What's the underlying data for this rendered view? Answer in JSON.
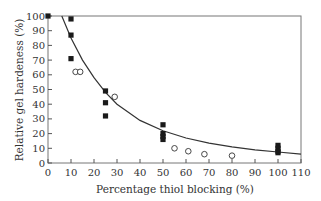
{
  "chart_data": {
    "type": "scatter",
    "title": "",
    "xlabel": "Percentage thiol blocking (%)",
    "ylabel": "Relative gel hardeness (%)",
    "xlim": [
      0,
      110
    ],
    "ylim": [
      0,
      100
    ],
    "x_ticks": [
      0,
      10,
      20,
      30,
      40,
      50,
      60,
      70,
      80,
      90,
      100,
      110
    ],
    "y_ticks": [
      0,
      10,
      20,
      30,
      40,
      50,
      60,
      70,
      80,
      90,
      100
    ],
    "grid": false,
    "legend": null,
    "series": [
      {
        "name": "filled squares",
        "marker": "square-filled",
        "color": "#1a1a1a",
        "points": [
          [
            0,
            100
          ],
          [
            10,
            98
          ],
          [
            10,
            87
          ],
          [
            10,
            71
          ],
          [
            25,
            49
          ],
          [
            25,
            41
          ],
          [
            25,
            32
          ],
          [
            50,
            26
          ],
          [
            50,
            20
          ],
          [
            50,
            18
          ],
          [
            50,
            16
          ],
          [
            100,
            12
          ],
          [
            100,
            10
          ],
          [
            100,
            8
          ],
          [
            100,
            7
          ]
        ]
      },
      {
        "name": "open circles",
        "marker": "circle-open",
        "color": "#333333",
        "points": [
          [
            12,
            62
          ],
          [
            14,
            62
          ],
          [
            29,
            45
          ],
          [
            55,
            10
          ],
          [
            61,
            8
          ],
          [
            68,
            6
          ],
          [
            80,
            5
          ]
        ]
      },
      {
        "name": "fitted curve",
        "marker": "line",
        "color": "#333333",
        "points": [
          [
            6,
            100
          ],
          [
            10,
            85
          ],
          [
            15,
            70
          ],
          [
            20,
            58
          ],
          [
            25,
            48
          ],
          [
            30,
            40
          ],
          [
            40,
            29
          ],
          [
            50,
            22
          ],
          [
            60,
            17
          ],
          [
            70,
            13.5
          ],
          [
            80,
            11
          ],
          [
            90,
            9
          ],
          [
            100,
            7.5
          ],
          [
            110,
            6
          ]
        ]
      }
    ]
  }
}
